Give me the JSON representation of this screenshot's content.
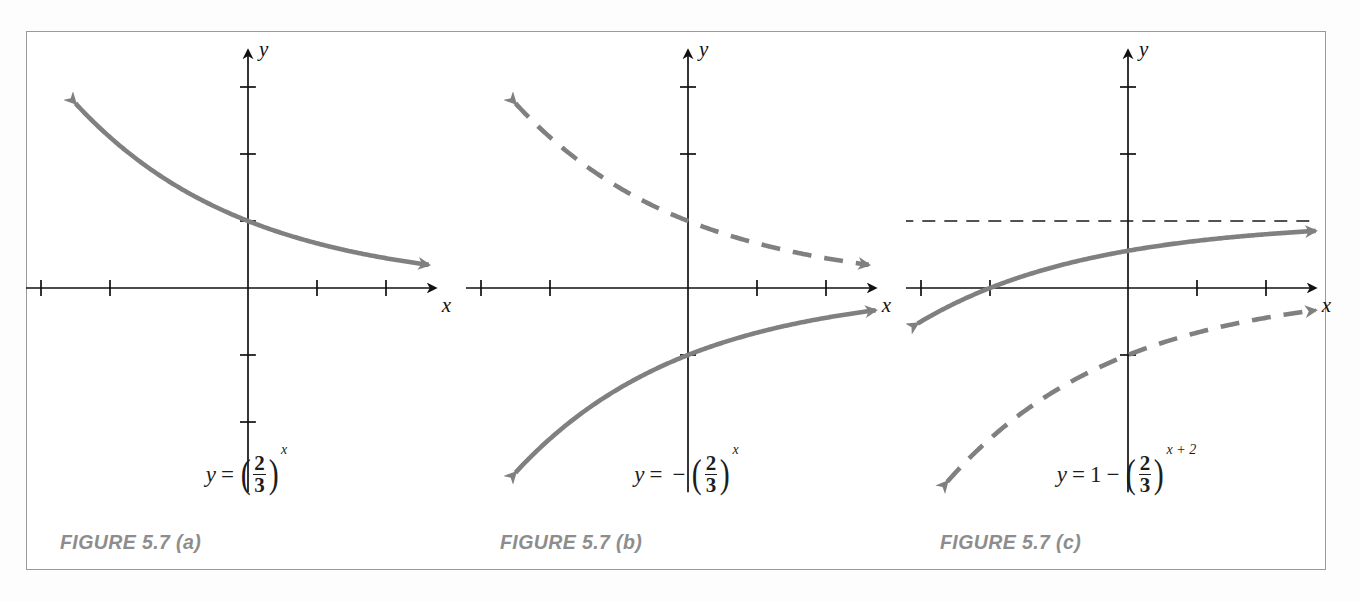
{
  "figure": {
    "background_color": "#ffffff",
    "border_color": "#9a9a9a",
    "curve_color": "#808080",
    "axis_color": "#111111",
    "asymptote_color": "#1a1a1a",
    "caption_color": "#8d8d8d"
  },
  "panels": [
    {
      "id": "a",
      "caption": "FIGURE 5.7 (a)",
      "equation": {
        "lhs": "y",
        "equals": "=",
        "leading": "",
        "sign": "",
        "open_paren": "(",
        "numerator": "2",
        "denominator": "3",
        "close_paren": ")",
        "exponent": "x",
        "plain": "y = (2/3)^x"
      },
      "axis": {
        "x_label": "x",
        "y_label": "y",
        "x_ticks": [
          -3,
          -2,
          1,
          2
        ],
        "y_ticks": [
          -2,
          -1,
          1,
          2,
          3
        ]
      },
      "curves": [
        {
          "name": "main-curve",
          "style": "solid",
          "function": "(2/3)^x",
          "arrow_start": true,
          "arrow_end": true
        }
      ],
      "asymptote": null
    },
    {
      "id": "b",
      "caption": "FIGURE 5.7 (b)",
      "equation": {
        "lhs": "y",
        "equals": "=",
        "leading": "",
        "sign": "−",
        "open_paren": "(",
        "numerator": "2",
        "denominator": "3",
        "close_paren": ")",
        "exponent": "x",
        "plain": "y = -(2/3)^x"
      },
      "axis": {
        "x_label": "x",
        "y_label": "y",
        "x_ticks": [
          -3,
          -2,
          1,
          2
        ],
        "y_ticks": [
          -1,
          2,
          3
        ]
      },
      "curves": [
        {
          "name": "reference-curve",
          "style": "dashed",
          "function": "(2/3)^x",
          "arrow_start": true,
          "arrow_end": true
        },
        {
          "name": "main-curve",
          "style": "solid",
          "function": "-(2/3)^x",
          "arrow_start": true,
          "arrow_end": true
        }
      ],
      "asymptote": null
    },
    {
      "id": "c",
      "caption": "FIGURE 5.7 (c)",
      "equation": {
        "lhs": "y",
        "equals": "=",
        "leading": "1",
        "sign": "−",
        "open_paren": "(",
        "numerator": "2",
        "denominator": "3",
        "close_paren": ")",
        "exponent": "x + 2",
        "plain": "y = 1 - (2/3)^(x+2)"
      },
      "axis": {
        "x_label": "x",
        "y_label": "y",
        "x_ticks": [
          -3,
          -2,
          1,
          2
        ],
        "y_ticks": [
          -1,
          2,
          3
        ]
      },
      "curves": [
        {
          "name": "main-curve",
          "style": "solid",
          "function": "1-(2/3)^(x+2)",
          "arrow_start": true,
          "arrow_end": true
        },
        {
          "name": "reference-curve",
          "style": "dashed",
          "function": "-(2/3)^x",
          "arrow_start": true,
          "arrow_end": true
        }
      ],
      "asymptote": {
        "name": "horizontal-asymptote",
        "y_value": 1,
        "style": "dashed"
      }
    }
  ],
  "chart_data": {
    "type": "line",
    "title": "",
    "xlabel": "x",
    "ylabel": "y",
    "panel_count": 3,
    "xlim": [
      -3.6,
      2.9
    ],
    "ylim": [
      -2.9,
      3.6
    ],
    "grid": false,
    "legend": "none",
    "x_tick_values": [
      -3,
      -2,
      -1,
      1,
      2
    ],
    "y_tick_values": [
      -2,
      -1,
      1,
      2,
      3
    ],
    "series": [
      {
        "panel": "a",
        "name": "y = (2/3)^x",
        "style": "solid",
        "x": [
          -3.5,
          -3,
          -2.5,
          -2,
          -1.5,
          -1,
          -0.5,
          0,
          0.5,
          1,
          1.5,
          2,
          2.5
        ],
        "y": [
          4.13,
          3.38,
          2.76,
          2.25,
          1.84,
          1.5,
          1.22,
          1.0,
          0.82,
          0.67,
          0.54,
          0.44,
          0.36
        ]
      },
      {
        "panel": "b",
        "name": "y = (2/3)^x (reference)",
        "style": "dashed",
        "x": [
          -3.5,
          -3,
          -2.5,
          -2,
          -1.5,
          -1,
          -0.5,
          0,
          0.5,
          1,
          1.5,
          2,
          2.5
        ],
        "y": [
          4.13,
          3.38,
          2.76,
          2.25,
          1.84,
          1.5,
          1.22,
          1.0,
          0.82,
          0.67,
          0.54,
          0.44,
          0.36
        ]
      },
      {
        "panel": "b",
        "name": "y = -(2/3)^x",
        "style": "solid",
        "x": [
          -3.5,
          -3,
          -2.5,
          -2,
          -1.5,
          -1,
          -0.5,
          0,
          0.5,
          1,
          1.5,
          2,
          2.5
        ],
        "y": [
          -4.13,
          -3.38,
          -2.76,
          -2.25,
          -1.84,
          -1.5,
          -1.22,
          -1.0,
          -0.82,
          -0.67,
          -0.54,
          -0.44,
          -0.36
        ]
      },
      {
        "panel": "c",
        "name": "y = 1 - (2/3)^(x+2)",
        "style": "solid",
        "x": [
          -3.5,
          -3,
          -2.5,
          -2,
          -1.5,
          -1,
          -0.5,
          0,
          0.5,
          1,
          1.5,
          2,
          2.5
        ],
        "y": [
          -1.25,
          -1.25,
          -0.5,
          0.0,
          0.18,
          0.33,
          0.46,
          0.56,
          0.64,
          0.7,
          0.76,
          0.8,
          0.84
        ]
      },
      {
        "panel": "c",
        "name": "y = -(2/3)^x (reference)",
        "style": "dashed",
        "x": [
          -3.5,
          -3,
          -2.5,
          -2,
          -1.5,
          -1,
          -0.5,
          0,
          0.5,
          1,
          1.5,
          2,
          2.5
        ],
        "y": [
          -4.13,
          -3.38,
          -2.76,
          -2.25,
          -1.84,
          -1.5,
          -1.22,
          -1.0,
          -0.82,
          -0.67,
          -0.54,
          -0.44,
          -0.36
        ]
      },
      {
        "panel": "c",
        "name": "asymptote y = 1",
        "style": "dashed-thin",
        "x": [
          -3.5,
          2.6
        ],
        "y": [
          1,
          1
        ]
      }
    ]
  }
}
